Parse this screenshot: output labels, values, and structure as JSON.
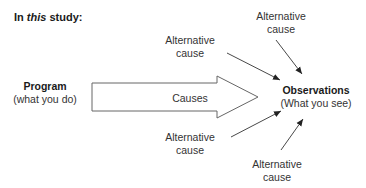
{
  "title": {
    "prefix": "In ",
    "emphasis": "this",
    "suffix": " study:"
  },
  "program": {
    "name": "Program",
    "desc": "(what you do)"
  },
  "arrow": {
    "label": "Causes"
  },
  "observations": {
    "name": "Observations",
    "desc": "(What you see)"
  },
  "alternatives": [
    {
      "line1": "Alternative",
      "line2": "cause",
      "position": "top-right"
    },
    {
      "line1": "Alternative",
      "line2": "cause",
      "position": "top-left"
    },
    {
      "line1": "Alternative",
      "line2": "cause",
      "position": "bottom-left"
    },
    {
      "line1": "Alternative",
      "line2": "cause",
      "position": "bottom-right"
    }
  ],
  "colors": {
    "stroke": "#444444",
    "text": "#333333"
  }
}
